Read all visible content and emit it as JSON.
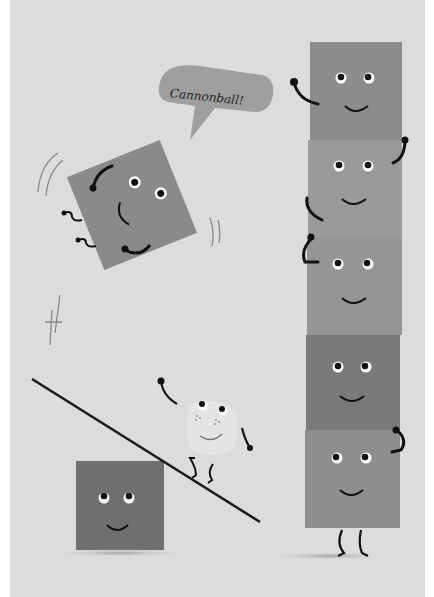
{
  "illustration": {
    "speech_bubble": {
      "text": "Cannonball!"
    },
    "colors": {
      "background": "#dcdcdc",
      "border": "#ffffff",
      "flying_block": "#8a8a8a",
      "tower_block_1": "#8c8c8c",
      "tower_block_2": "#9a9a9a",
      "tower_block_3": "#959595",
      "tower_block_4": "#7a7a7a",
      "tower_block_5": "#8e8e8e",
      "ground_block": "#6f6f6f",
      "small_character": "#e4e4e4",
      "ink": "#1a1a1a",
      "bubble": "#9e9e9e"
    },
    "characters": [
      {
        "name": "flying-block",
        "pose": "jumping"
      },
      {
        "name": "tower-block-1",
        "pose": "waving"
      },
      {
        "name": "tower-block-2",
        "pose": "smiling"
      },
      {
        "name": "tower-block-3",
        "pose": "smiling"
      },
      {
        "name": "tower-block-4",
        "pose": "smiling"
      },
      {
        "name": "tower-block-5",
        "pose": "standing"
      },
      {
        "name": "ground-block",
        "pose": "smiling"
      },
      {
        "name": "small-character",
        "pose": "walking-up-plank"
      }
    ]
  }
}
